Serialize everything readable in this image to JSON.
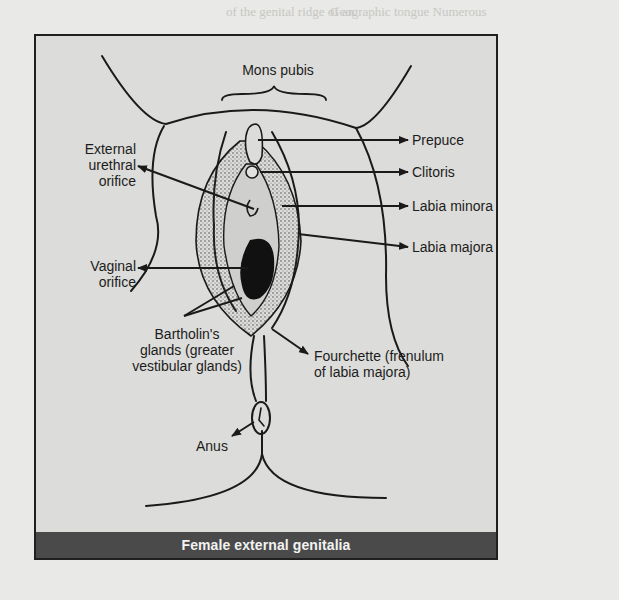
{
  "background_text": {
    "top_left": "of the genital ridge of an",
    "top_right": "Geographic tongue Numerous",
    "right_column": [
      "surface containing a geogra-",
      "phical pattern.",
      "Gerdy's fibers",
      "transverse ligament of palm",
      "Geriatrics The study of various",
      "aspects"
    ],
    "left_column": [
      "Germination Development of",
      "interpolated germ into an",
      "embryo or sprouting of spore",
      "blastema Neoplasm arising",
      "from germ cells of testis or",
      "conception to birth, usually",
      "development is the uterus"
    ]
  },
  "figure": {
    "caption": "Female external genitalia",
    "labels": {
      "mons_pubis": "Mons pubis",
      "external_urethral_orifice": [
        "External",
        "urethral",
        "orifice"
      ],
      "vaginal_orifice": [
        "Vaginal",
        "orifice"
      ],
      "bartholins_glands": [
        "Bartholin's",
        "glands (greater",
        "vestibular glands)"
      ],
      "anus": "Anus",
      "prepuce": "Prepuce",
      "clitoris": "Clitoris",
      "labia_minora": "Labia minora",
      "labia_majora": "Labia majora",
      "fourchette": [
        "Fourchette (frenulum",
        "of labia majora)"
      ]
    }
  },
  "colors": {
    "frame_border": "#1f1f1f",
    "figure_background": "#dcdcda",
    "caption_bar": "#4a4a4a",
    "caption_text": "#f2f2f2",
    "line_art": "#1a1a1a"
  }
}
